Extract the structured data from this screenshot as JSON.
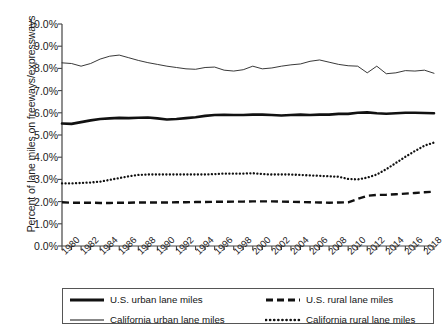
{
  "chart_data": {
    "type": "line",
    "title": "",
    "xlabel": "",
    "ylabel": "Percent of lane miles on freeways/expressways",
    "ylim": [
      0,
      10
    ],
    "ytick_labels": [
      "0.0%",
      "1.0%",
      "2.0%",
      "3.0%",
      "4.0%",
      "5.0%",
      "6.0%",
      "7.0%",
      "8.0%",
      "9.0%",
      "10.0%"
    ],
    "ytick_values": [
      0,
      1,
      2,
      3,
      4,
      5,
      6,
      7,
      8,
      9,
      10
    ],
    "xlim": [
      1980,
      2019
    ],
    "x": [
      1980,
      1981,
      1982,
      1983,
      1984,
      1985,
      1986,
      1987,
      1988,
      1989,
      1990,
      1991,
      1992,
      1993,
      1994,
      1995,
      1996,
      1997,
      1998,
      1999,
      2000,
      2001,
      2002,
      2003,
      2004,
      2005,
      2006,
      2007,
      2008,
      2009,
      2010,
      2011,
      2012,
      2013,
      2014,
      2015,
      2016,
      2017,
      2018,
      2019
    ],
    "xtick_labels": [
      "1980",
      "1982",
      "1984",
      "1986",
      "1988",
      "1990",
      "1992",
      "1994",
      "1996",
      "1998",
      "2000",
      "2002",
      "2004",
      "2006",
      "2008",
      "2010",
      "2012",
      "2014",
      "2016",
      "2018"
    ],
    "grid": false,
    "legend_position": "bottom",
    "series": [
      {
        "name": "U.S. urban lane miles",
        "style": "solid-thick",
        "color": "#111111",
        "values": [
          5.52,
          5.5,
          5.58,
          5.66,
          5.72,
          5.75,
          5.77,
          5.76,
          5.78,
          5.79,
          5.75,
          5.7,
          5.72,
          5.76,
          5.8,
          5.86,
          5.9,
          5.91,
          5.9,
          5.9,
          5.92,
          5.92,
          5.9,
          5.88,
          5.9,
          5.92,
          5.9,
          5.92,
          5.92,
          5.95,
          5.95,
          6.0,
          6.02,
          5.98,
          5.96,
          5.98,
          6.0,
          6.0,
          5.99,
          5.98
        ]
      },
      {
        "name": "U.S. rural lane miles",
        "style": "dashed",
        "color": "#111111",
        "values": [
          1.97,
          1.95,
          1.95,
          1.95,
          1.94,
          1.94,
          1.95,
          1.95,
          1.96,
          1.96,
          1.96,
          1.96,
          1.97,
          1.97,
          1.98,
          1.98,
          1.99,
          1.99,
          2.0,
          2.0,
          2.01,
          2.01,
          2.01,
          2.0,
          1.99,
          1.98,
          1.97,
          1.96,
          1.95,
          1.96,
          1.97,
          2.12,
          2.26,
          2.3,
          2.31,
          2.33,
          2.36,
          2.39,
          2.42,
          2.45
        ]
      },
      {
        "name": "California urban lane miles",
        "style": "solid-thin",
        "color": "#222222",
        "values": [
          8.25,
          8.22,
          8.1,
          8.22,
          8.42,
          8.55,
          8.6,
          8.48,
          8.36,
          8.26,
          8.18,
          8.1,
          8.04,
          7.98,
          7.96,
          8.04,
          8.06,
          7.92,
          7.88,
          7.94,
          8.1,
          7.98,
          8.02,
          8.1,
          8.16,
          8.2,
          8.32,
          8.38,
          8.28,
          8.18,
          8.12,
          8.1,
          7.8,
          8.1,
          7.76,
          7.8,
          7.9,
          7.88,
          7.92,
          7.78
        ]
      },
      {
        "name": "California rural lane miles",
        "style": "dotted",
        "color": "#111111",
        "values": [
          2.82,
          2.82,
          2.84,
          2.86,
          2.9,
          2.98,
          3.06,
          3.14,
          3.2,
          3.22,
          3.22,
          3.22,
          3.22,
          3.22,
          3.22,
          3.22,
          3.24,
          3.26,
          3.26,
          3.26,
          3.28,
          3.24,
          3.22,
          3.22,
          3.22,
          3.2,
          3.18,
          3.16,
          3.14,
          3.12,
          3.02,
          3.0,
          3.08,
          3.22,
          3.46,
          3.74,
          4.02,
          4.28,
          4.52,
          4.66
        ]
      }
    ]
  },
  "legend": {
    "items": [
      {
        "label": "U.S. urban lane miles",
        "style": "solid-thick"
      },
      {
        "label": "U.S. rural lane miles",
        "style": "dashed"
      },
      {
        "label": "California urban lane miles",
        "style": "solid-thin"
      },
      {
        "label": "California rural lane miles",
        "style": "dotted"
      }
    ]
  }
}
